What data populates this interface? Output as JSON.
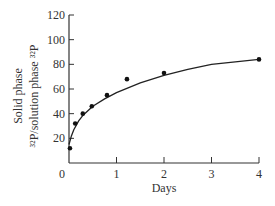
{
  "chart_data": {
    "type": "scatter",
    "title": "",
    "xlabel": "Days",
    "ylabel_line1": "Solid phase",
    "ylabel_line2": "³²P/solution phase ³²P",
    "xlim": [
      0,
      4
    ],
    "ylim": [
      0,
      120
    ],
    "x_ticks": [
      0,
      1,
      2,
      3,
      4
    ],
    "y_ticks": [
      20,
      40,
      60,
      80,
      100,
      120
    ],
    "x_tick_labels": [
      "0",
      "1",
      "2",
      "3",
      "4"
    ],
    "y_tick_labels": [
      "20",
      "40",
      "60",
      "80",
      "100",
      "120"
    ],
    "origin_label": "0",
    "grid": false,
    "legend": null,
    "series": [
      {
        "name": "Measured points",
        "x": [
          0.02,
          0.13,
          0.29,
          0.48,
          0.8,
          1.22,
          2.0,
          4.0
        ],
        "y": [
          12,
          32,
          40,
          46,
          55,
          68,
          73,
          84
        ]
      },
      {
        "name": "Fitted curve",
        "style": "line",
        "x": [
          0.0,
          0.05,
          0.1,
          0.2,
          0.3,
          0.5,
          0.75,
          1.0,
          1.5,
          2.0,
          2.5,
          3.0,
          3.5,
          4.0
        ],
        "y": [
          15,
          22,
          27,
          34,
          39,
          46,
          52,
          57,
          65,
          71,
          76,
          80,
          82,
          84
        ]
      }
    ]
  }
}
